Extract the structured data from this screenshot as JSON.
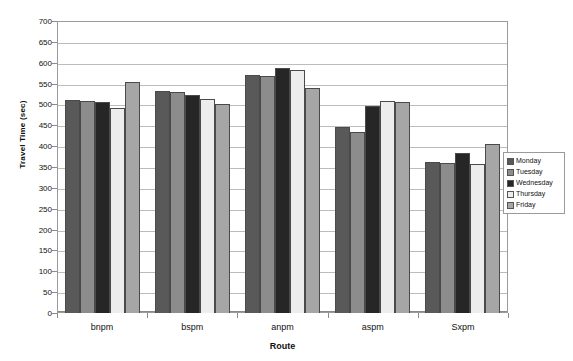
{
  "chart_data": {
    "type": "bar",
    "title": "",
    "xlabel": "Route",
    "ylabel": "Travel Time (sec)",
    "categories": [
      "bnpm",
      "bspm",
      "anpm",
      "aspm",
      "Sxpm"
    ],
    "series": [
      {
        "name": "Monday",
        "color": "#595959",
        "values": [
          511,
          532,
          570,
          447,
          363
        ]
      },
      {
        "name": "Tuesday",
        "color": "#8c8c8c",
        "values": [
          509,
          530,
          567,
          435,
          360
        ]
      },
      {
        "name": "Wednesday",
        "color": "#262626",
        "values": [
          506,
          522,
          588,
          496,
          383
        ]
      },
      {
        "name": "Thursday",
        "color": "#ededed",
        "values": [
          491,
          514,
          583,
          509,
          357
        ]
      },
      {
        "name": "Friday",
        "color": "#a6a6a6",
        "values": [
          553,
          502,
          540,
          506,
          405
        ]
      }
    ],
    "ylim": [
      0,
      700
    ],
    "yticks": [
      0,
      50,
      100,
      150,
      200,
      250,
      300,
      350,
      400,
      450,
      500,
      550,
      600,
      650,
      700
    ],
    "grid": true,
    "legend_position": "right"
  },
  "legend": {
    "items": [
      {
        "label": "Monday"
      },
      {
        "label": "Tuesday"
      },
      {
        "label": "Wednesday"
      },
      {
        "label": "Thursday"
      },
      {
        "label": "Friday"
      }
    ]
  },
  "colors": {
    "plot_border": "#9a9a9a",
    "gridline": "#bcbcbc",
    "bar_outline": "#4a4a4a",
    "text": "#111111",
    "background": "#ffffff"
  }
}
